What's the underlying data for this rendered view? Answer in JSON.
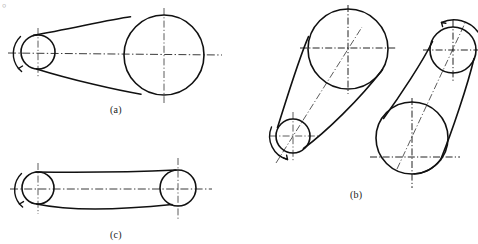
{
  "document": {
    "type": "engineering-drawing",
    "subject": "belt-drive transmission diagrams",
    "top_caption_clipped": "。",
    "figure_labels": [
      {
        "id": "a",
        "text": "(a)",
        "x": 110,
        "y": 104
      },
      {
        "id": "b",
        "text": "(b)",
        "x": 350,
        "y": 189
      },
      {
        "id": "c",
        "text": "(c)",
        "x": 110,
        "y": 229
      }
    ],
    "colors": {
      "outline": "#111111",
      "centerline": "#4a4a4a",
      "background": "#ffffff",
      "label": "#1a1a1a"
    }
  },
  "figures": {
    "a": {
      "label": "(a)",
      "description": "open belt drive, small driver pulley left, large driven pulley right, horizontal shaft axis",
      "pulleys": [
        {
          "name": "small-pulley",
          "cx": 38,
          "cy": 52,
          "r": 17
        },
        {
          "name": "large-pulley",
          "cx": 164,
          "cy": 55,
          "r": 40
        }
      ],
      "axis": {
        "name": "horizontal-center-axis",
        "x1": 8,
        "y1": 53,
        "x2": 222,
        "y2": 55
      },
      "rotation_arrow": {
        "name": "rotation-arc",
        "cx": 38,
        "cy": 52,
        "r": 24
      }
    },
    "b": {
      "label": "(b)",
      "left_assembly": {
        "description": "inclined belt drive, large pulley upper right, small pulley lower left",
        "pulleys": [
          {
            "name": "large-pulley",
            "cx": 348,
            "cy": 49,
            "r": 40
          },
          {
            "name": "small-pulley",
            "cx": 293,
            "cy": 136,
            "r": 17
          }
        ],
        "center_axis": {
          "x1": 293,
          "y1": 136,
          "x2": 348,
          "y2": 49
        },
        "rotation_arrow": {
          "cx": 293,
          "cy": 136,
          "r": 24
        }
      },
      "right_assembly": {
        "description": "inclined belt drive, small pulley upper right, large pulley lower left",
        "pulleys": [
          {
            "name": "small-pulley",
            "cx": 453,
            "cy": 50,
            "r": 23
          },
          {
            "name": "large-pulley",
            "cx": 412,
            "cy": 138,
            "r": 36
          }
        ],
        "center_axis": {
          "x1": 412,
          "y1": 138,
          "x2": 453,
          "y2": 50
        },
        "rotation_arrow": {
          "cx": 453,
          "cy": 50,
          "r": 30
        }
      }
    },
    "c": {
      "label": "(c)",
      "description": "near-equal pulleys, open belt drive, horizontal shaft axis",
      "pulleys": [
        {
          "name": "left-pulley",
          "cx": 38,
          "cy": 188,
          "r": 16
        },
        {
          "name": "right-pulley",
          "cx": 178,
          "cy": 188,
          "r": 18
        }
      ],
      "axis": {
        "name": "horizontal-center-axis",
        "x1": 10,
        "y1": 189,
        "x2": 212,
        "y2": 189
      },
      "rotation_arrow": {
        "cx": 38,
        "cy": 188,
        "r": 23
      }
    }
  }
}
